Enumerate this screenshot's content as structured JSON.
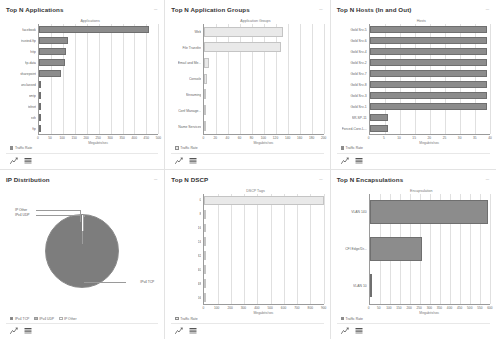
{
  "panels": [
    {
      "title": "Top N Applications",
      "collapse_icon": "–",
      "legend": [
        {
          "label": "Traffic Rate",
          "color": "#8c8c8c"
        }
      ],
      "tools": [
        "chart-view-icon",
        "table-view-icon"
      ],
      "chart_data": {
        "type": "bar",
        "orientation": "horizontal",
        "title": "Top N Applications",
        "ylabel": "Applications",
        "xlabel": "Megabits/sec",
        "categories": [
          "facebook",
          "trusted-ftp",
          "http",
          "ftp-data",
          "sharepoint",
          "unclassed",
          "smtp",
          "telnet",
          "ssh",
          "ftp"
        ],
        "values": [
          462,
          122,
          112,
          110,
          92,
          7,
          5,
          3,
          2,
          1
        ],
        "xlim": [
          0,
          500
        ],
        "xticks": [
          0,
          50,
          100,
          150,
          200,
          250,
          300,
          350,
          400,
          450,
          500
        ],
        "grid": true,
        "bar_color": "#8c8c8c"
      }
    },
    {
      "title": "Top N Application Groups",
      "collapse_icon": "–",
      "legend": [
        {
          "label": "Traffic Rate",
          "color": "#e9e9e9"
        }
      ],
      "tools": [
        "chart-view-icon",
        "table-view-icon"
      ],
      "chart_data": {
        "type": "bar",
        "orientation": "horizontal",
        "title": "Top N Application Groups",
        "ylabel": "Application Groups",
        "xlabel": "Megabits/sec",
        "categories": [
          "Web",
          "File Transfer",
          "Email and Me...",
          "Console",
          "Streaming",
          "Conf Manage...",
          "Name Services"
        ],
        "values": [
          132,
          128,
          8,
          5,
          0,
          0,
          0
        ],
        "xlim": [
          0,
          200
        ],
        "xticks": [
          0,
          20,
          40,
          60,
          80,
          100,
          120,
          140,
          160,
          180,
          200
        ],
        "grid": true,
        "bar_color": "#e9e9e9"
      }
    },
    {
      "title": "Top N Hosts (In and Out)",
      "collapse_icon": "–",
      "legend": [
        {
          "label": "Traffic Rate",
          "color": "#8c8c8c"
        }
      ],
      "tools": [
        "chart-view-icon",
        "table-view-icon"
      ],
      "chart_data": {
        "type": "bar",
        "orientation": "horizontal",
        "title": "Top N Hosts (In and Out)",
        "ylabel": "Hosts",
        "xlabel": "Megabits/sec",
        "categories": [
          "Gold Srv-5",
          "Gold Srv-6",
          "Gold Srv-4",
          "Gold Srv-2",
          "Gold Srv-7",
          "Gold Srv-8",
          "Gold Srv-3",
          "Gold Srv-1",
          "SR-SP-11",
          "Forced-Core-L..."
        ],
        "values": [
          39,
          39,
          39,
          39,
          39,
          39,
          39,
          39,
          6,
          6
        ],
        "xlim": [
          0,
          40
        ],
        "xticks": [
          0,
          5,
          10,
          15,
          20,
          25,
          30,
          35,
          40
        ],
        "grid": true,
        "bar_color": "#8c8c8c"
      }
    },
    {
      "title": "IP Distribution",
      "collapse_icon": "–",
      "legend": [
        {
          "label": "IPv4 TCP",
          "color": "#7d7d7d"
        },
        {
          "label": "IPv4 UDP",
          "color": "#b5b5b5"
        },
        {
          "label": "IP Other",
          "color": "#ffffff"
        }
      ],
      "tools": [
        "chart-view-icon",
        "table-view-icon"
      ],
      "chart_data": {
        "type": "pie",
        "title": "IP Distribution",
        "labels": [
          "IPv4 TCP",
          "IPv4 UDP",
          "IP Other"
        ],
        "values": [
          98.8,
          0.8,
          0.4
        ],
        "callouts": [
          "IP Other",
          "IPv4 UDP",
          "IPv4 TCP"
        ],
        "colors": [
          "#7d7d7d",
          "#b5b5b5",
          "#ffffff"
        ]
      }
    },
    {
      "title": "Top N DSCP",
      "collapse_icon": "–",
      "legend": [
        {
          "label": "Traffic Rate",
          "color": "#e9e9e9"
        }
      ],
      "tools": [
        "chart-view-icon",
        "table-view-icon"
      ],
      "chart_data": {
        "type": "bar",
        "orientation": "horizontal",
        "title": "Top N DSCP",
        "ylabel": "DSCP Tags",
        "xlabel": "Megabits/sec",
        "categories": [
          "0",
          "8",
          "16",
          "24",
          "32",
          "40",
          "48",
          "56"
        ],
        "values": [
          900,
          0,
          0,
          0,
          0,
          0,
          0,
          0
        ],
        "xlim": [
          0,
          900
        ],
        "xticks": [
          0,
          100,
          200,
          300,
          400,
          500,
          600,
          700,
          800,
          900
        ],
        "grid": true,
        "bar_color": "#e9e9e9"
      }
    },
    {
      "title": "Top N Encapsulations",
      "collapse_icon": "–",
      "legend": [
        {
          "label": "Traffic Rate",
          "color": "#8c8c8c"
        }
      ],
      "tools": [
        "chart-view-icon",
        "table-view-icon"
      ],
      "chart_data": {
        "type": "bar",
        "orientation": "horizontal",
        "title": "Top N Encapsulations",
        "ylabel": "Encapsulation",
        "xlabel": "Megabits/sec",
        "categories": [
          "VLAN 140",
          "CFI Edge/Dr...",
          "VLAN 10"
        ],
        "values": [
          590,
          262,
          0
        ],
        "xlim": [
          0,
          600
        ],
        "xticks": [
          0,
          50,
          100,
          150,
          200,
          250,
          300,
          350,
          400,
          450,
          500,
          550,
          600
        ],
        "grid": true,
        "bar_color": "#8c8c8c"
      }
    }
  ]
}
